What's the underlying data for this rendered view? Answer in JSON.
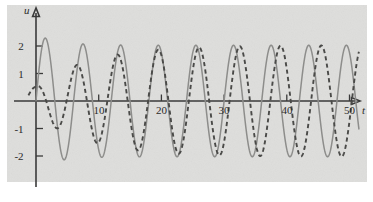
{
  "figure": {
    "background_color": "#ffffff",
    "plot_background_color": "#dededc"
  },
  "axes": {
    "y_axis_name": "u",
    "x_axis_name": "t",
    "x_ticks": [
      10,
      20,
      30,
      40,
      50
    ],
    "x_tick_labels": [
      "10",
      "20",
      "30",
      "40",
      "50"
    ],
    "y_ticks": [
      2,
      1,
      -1,
      -2
    ],
    "y_tick_labels": [
      "2",
      "1",
      "-1",
      "-2"
    ]
  },
  "chart_data": {
    "type": "line",
    "title": "",
    "subtitle": "",
    "xlabel": "t",
    "ylabel": "u",
    "xlim": [
      -1.5,
      53
    ],
    "ylim": [
      -2.9,
      2.9
    ],
    "grid": false,
    "legend": null,
    "annotations": [],
    "x_tick_values": [
      10,
      20,
      30,
      40,
      50
    ],
    "y_tick_values": [
      2,
      1,
      -1,
      -2
    ],
    "series": [
      {
        "name": "solid-curve",
        "style": "solid",
        "color": "#8d8d8b",
        "formula": "u = A1(t) * sin(w1 * t + p1)",
        "amplitude_start": 2.45,
        "amplitude_end": 2.05,
        "angular_frequency": 1.0472,
        "phase": 0.0,
        "t_start": 0.0,
        "t_end": 51.5,
        "sample_step": 0.05
      },
      {
        "name": "dashed-curve",
        "style": "dashed",
        "color": "#4a4a48",
        "formula": "u = A2(t) * sin(w2 * t + p2)",
        "amplitude_start": 0.52,
        "amplitude_end": 2.05,
        "amplitude_growth_rate": 0.115,
        "angular_frequency": 0.9666,
        "phase": 1.5708,
        "t_start": -1.2,
        "t_end": 51.5,
        "sample_step": 0.05
      }
    ]
  },
  "geometry": {
    "plot_left_px": 7,
    "plot_top_px": 5,
    "plot_width_px": 360,
    "plot_height_px": 177,
    "origin_x_px": 36,
    "origin_y_px": 101,
    "px_per_unit_x": 6.27,
    "px_per_unit_y": 27.2
  }
}
